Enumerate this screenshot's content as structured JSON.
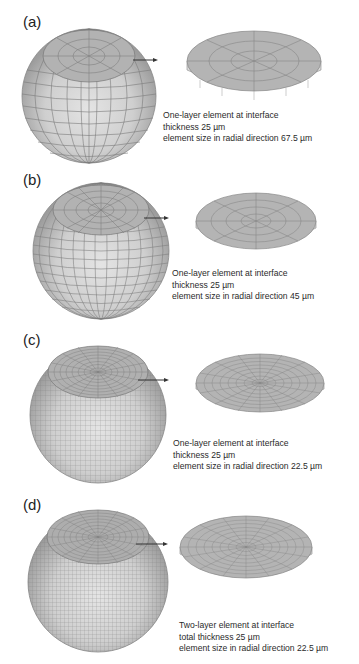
{
  "figure": {
    "panels": [
      {
        "id": "a",
        "label": "(a)",
        "mesh_divisions": 8,
        "caption": {
          "line1": "One-layer element at interface",
          "line2": "thickness 25 µm",
          "line3": "element size in radial direction 67.5 µm"
        }
      },
      {
        "id": "b",
        "label": "(b)",
        "mesh_divisions": 12,
        "caption": {
          "line1": "One-layer element at interface",
          "line2": "thickness 25 µm",
          "line3": "element size in radial direction 45 µm"
        }
      },
      {
        "id": "c",
        "label": "(c)",
        "mesh_divisions": 24,
        "caption": {
          "line1": "One-layer element at interface",
          "line2": "thickness 25 µm",
          "line3": "element size in radial direction 22.5 µm"
        }
      },
      {
        "id": "d",
        "label": "(d)",
        "mesh_divisions": 24,
        "caption": {
          "line1": "Two-layer element at interface",
          "line2": "total thickness 25 µm",
          "line3": "element size in radial direction 22.5 µm"
        }
      }
    ],
    "colors": {
      "sphere_light": "#d9d9d9",
      "sphere_dark": "#a9a9a9",
      "mesh_line": "#6e6e6e",
      "disk_top": "#b4b4b4",
      "disk_side": "#dcdcdc",
      "arrow": "#333333"
    }
  }
}
